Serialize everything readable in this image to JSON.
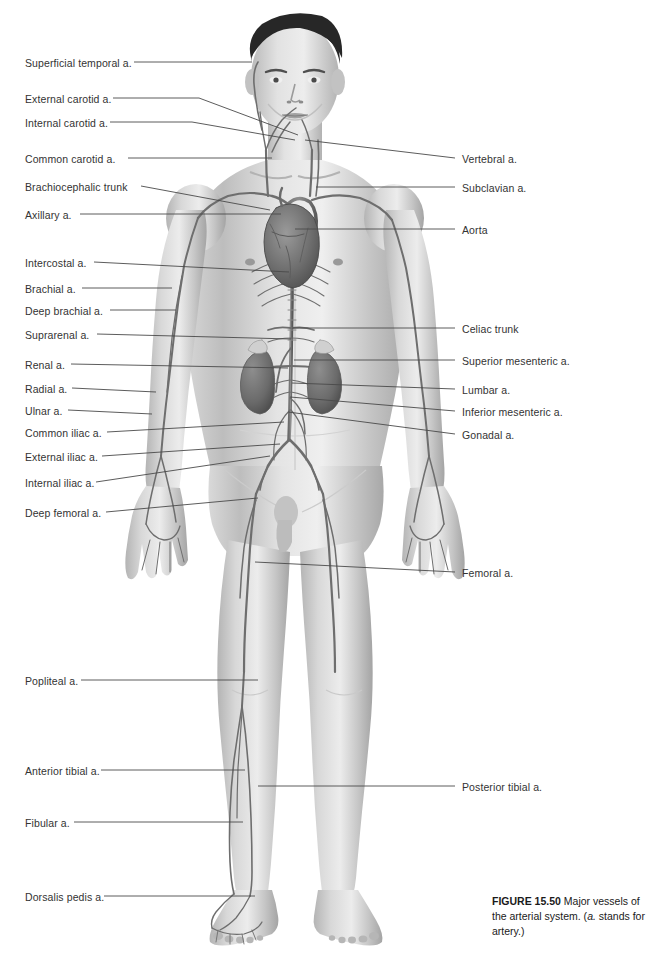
{
  "figure": {
    "domain": "anatomical-illustration",
    "background_color": "#ffffff",
    "text_color": "#333333",
    "leader_line_color": "#4a4a4a"
  },
  "caption": {
    "number": "FIGURE 15.50",
    "text_before_italic": " Major vessels of the arterial system. (",
    "italic": "a.",
    "text_after_italic": " stands for artery.)"
  },
  "labels_left": [
    {
      "id": "superficial-temporal",
      "text": "Superficial temporal a.",
      "x": 25,
      "y": 58,
      "line": [
        [
          134,
          62
        ],
        [
          252,
          62
        ]
      ]
    },
    {
      "id": "external-carotid",
      "text": "External carotid a.",
      "x": 25,
      "y": 94,
      "line": [
        [
          113,
          98
        ],
        [
          199,
          98
        ],
        [
          298,
          135
        ]
      ]
    },
    {
      "id": "internal-carotid",
      "text": "Internal carotid a.",
      "x": 25,
      "y": 118,
      "line": [
        [
          110,
          122
        ],
        [
          192,
          122
        ],
        [
          295,
          140
        ]
      ]
    },
    {
      "id": "common-carotid",
      "text": "Common carotid a.",
      "x": 25,
      "y": 154,
      "line": [
        [
          128,
          158
        ],
        [
          272,
          158
        ]
      ]
    },
    {
      "id": "brachiocephalic-trunk",
      "text": "Brachiocephalic trunk",
      "x": 25,
      "y": 182,
      "line": [
        [
          141,
          186
        ],
        [
          270,
          210
        ]
      ]
    },
    {
      "id": "axillary",
      "text": "Axillary a.",
      "x": 25,
      "y": 210,
      "line": [
        [
          80,
          214
        ],
        [
          281,
          214
        ]
      ]
    },
    {
      "id": "intercostal",
      "text": "Intercostal a.",
      "x": 25,
      "y": 258,
      "line": [
        [
          94,
          262
        ],
        [
          289,
          272
        ]
      ]
    },
    {
      "id": "brachial",
      "text": "Brachial a.",
      "x": 25,
      "y": 284,
      "line": [
        [
          82,
          288
        ],
        [
          172,
          288
        ]
      ]
    },
    {
      "id": "deep-brachial",
      "text": "Deep brachial a.",
      "x": 25,
      "y": 306,
      "line": [
        [
          110,
          310
        ],
        [
          176,
          310
        ]
      ]
    },
    {
      "id": "suprarenal",
      "text": "Suprarenal a.",
      "x": 25,
      "y": 330,
      "line": [
        [
          97,
          334
        ],
        [
          291,
          339
        ]
      ]
    },
    {
      "id": "renal",
      "text": "Renal a.",
      "x": 25,
      "y": 360,
      "line": [
        [
          71,
          364
        ],
        [
          288,
          368
        ]
      ]
    },
    {
      "id": "radial",
      "text": "Radial a.",
      "x": 25,
      "y": 384,
      "line": [
        [
          72,
          388
        ],
        [
          156,
          392
        ]
      ]
    },
    {
      "id": "ulnar",
      "text": "Ulnar a.",
      "x": 25,
      "y": 406,
      "line": [
        [
          68,
          410
        ],
        [
          152,
          414
        ]
      ]
    },
    {
      "id": "common-iliac",
      "text": "Common iliac a.",
      "x": 25,
      "y": 428,
      "line": [
        [
          107,
          432
        ],
        [
          284,
          422
        ]
      ]
    },
    {
      "id": "external-iliac",
      "text": "External iliac a.",
      "x": 25,
      "y": 452,
      "line": [
        [
          102,
          456
        ],
        [
          280,
          444
        ]
      ]
    },
    {
      "id": "internal-iliac",
      "text": "Internal iliac a.",
      "x": 25,
      "y": 478,
      "line": [
        [
          96,
          482
        ],
        [
          270,
          456
        ]
      ]
    },
    {
      "id": "deep-femoral",
      "text": "Deep femoral a.",
      "x": 25,
      "y": 508,
      "line": [
        [
          106,
          512
        ],
        [
          258,
          498
        ]
      ]
    },
    {
      "id": "popliteal",
      "text": "Popliteal a.",
      "x": 25,
      "y": 676,
      "line": [
        [
          81,
          680
        ],
        [
          258,
          680
        ]
      ]
    },
    {
      "id": "anterior-tibial",
      "text": "Anterior tibial a.",
      "x": 25,
      "y": 766,
      "line": [
        [
          101,
          770
        ],
        [
          245,
          770
        ]
      ]
    },
    {
      "id": "fibular",
      "text": "Fibular a.",
      "x": 25,
      "y": 818,
      "line": [
        [
          74,
          822
        ],
        [
          243,
          822
        ]
      ]
    },
    {
      "id": "dorsalis-pedis",
      "text": "Dorsalis pedis a.",
      "x": 25,
      "y": 892,
      "line": [
        [
          104,
          896
        ],
        [
          255,
          896
        ]
      ]
    }
  ],
  "labels_right": [
    {
      "id": "vertebral",
      "text": "Vertebral a.",
      "x": 462,
      "y": 154,
      "line": [
        [
          455,
          158
        ],
        [
          305,
          140
        ]
      ]
    },
    {
      "id": "subclavian",
      "text": "Subclavian a.",
      "x": 462,
      "y": 183,
      "line": [
        [
          455,
          187
        ],
        [
          316,
          187
        ]
      ]
    },
    {
      "id": "aorta",
      "text": "Aorta",
      "x": 462,
      "y": 225,
      "line": [
        [
          455,
          229
        ],
        [
          295,
          229
        ]
      ]
    },
    {
      "id": "celiac-trunk",
      "text": "Celiac trunk",
      "x": 462,
      "y": 324,
      "line": [
        [
          455,
          328
        ],
        [
          292,
          328
        ]
      ]
    },
    {
      "id": "superior-mesenteric",
      "text": "Superior mesenteric a.",
      "x": 462,
      "y": 356,
      "line": [
        [
          455,
          360
        ],
        [
          294,
          360
        ]
      ]
    },
    {
      "id": "lumbar",
      "text": "Lumbar a.",
      "x": 462,
      "y": 385,
      "line": [
        [
          455,
          389
        ],
        [
          292,
          383
        ]
      ]
    },
    {
      "id": "inferior-mesenteric",
      "text": "Inferior mesenteric a.",
      "x": 462,
      "y": 407,
      "line": [
        [
          455,
          411
        ],
        [
          290,
          397
        ]
      ]
    },
    {
      "id": "gonadal",
      "text": "Gonadal a.",
      "x": 462,
      "y": 430,
      "line": [
        [
          455,
          434
        ],
        [
          288,
          412
        ]
      ]
    },
    {
      "id": "femoral",
      "text": "Femoral a.",
      "x": 462,
      "y": 568,
      "line": [
        [
          455,
          572
        ],
        [
          255,
          562
        ]
      ]
    },
    {
      "id": "posterior-tibial",
      "text": "Posterior tibial a.",
      "x": 462,
      "y": 782,
      "line": [
        [
          455,
          786
        ],
        [
          258,
          786
        ]
      ]
    }
  ]
}
